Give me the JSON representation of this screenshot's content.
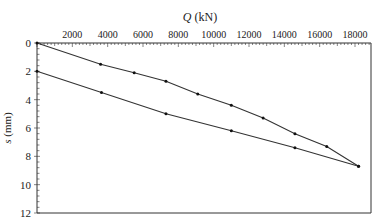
{
  "chart_data": {
    "type": "line",
    "title": "",
    "xlabel": "Q (kN)",
    "xlabel_italic": "Q",
    "xlabel_unit": "(kN)",
    "ylabel": "s (mm)",
    "ylabel_italic": "s",
    "ylabel_unit": "(mm)",
    "xlim": [
      0,
      19000
    ],
    "ylim": [
      12,
      0
    ],
    "x_axis_position": "top",
    "y_inverted": true,
    "grid": false,
    "legend": null,
    "x_ticks": [
      2000,
      4000,
      6000,
      8000,
      10000,
      12000,
      14000,
      16000,
      18000
    ],
    "x_tick_labels": [
      "2000",
      "4000",
      "6000",
      "8000",
      "10000",
      "12000",
      "14000",
      "16000",
      "18000"
    ],
    "y_ticks": [
      0,
      2,
      4,
      6,
      8,
      10,
      12
    ],
    "y_tick_labels": [
      "0",
      "2",
      "4",
      "6",
      "8",
      "10",
      "12"
    ],
    "series": [
      {
        "name": "loading",
        "x": [
          0,
          3600,
          5500,
          7300,
          9100,
          11000,
          12800,
          14600,
          16400,
          18200
        ],
        "y": [
          0,
          1.5,
          2.1,
          2.7,
          3.6,
          4.4,
          5.3,
          6.4,
          7.3,
          8.7
        ]
      },
      {
        "name": "unloading",
        "x": [
          0,
          3650,
          7300,
          11000,
          14600,
          18200
        ],
        "y": [
          2.0,
          3.5,
          5.0,
          6.2,
          7.4,
          8.7
        ]
      }
    ]
  },
  "colors": {
    "line": "#333333",
    "axis": "#333333",
    "background": "#ffffff"
  }
}
